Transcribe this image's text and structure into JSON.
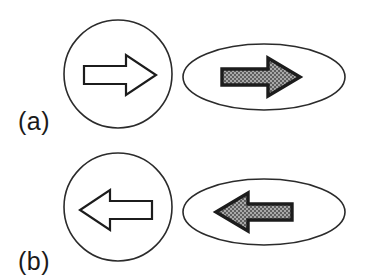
{
  "figure": {
    "background_color": "#ffffff",
    "width": 372,
    "height": 279,
    "outline_color": "#2b2b2b",
    "arrow_outline_color": "#1c1c1c",
    "arrow_hollow_fill": "#ffffff",
    "arrow_shaded_fill": "#9a9a9a",
    "arrow_shaded_pattern": "checkerboard-halftone",
    "label_color": "#1a1a1a"
  },
  "panels": [
    {
      "id": "a",
      "label": "(a)",
      "label_x": 18,
      "label_y": 130,
      "shapes": [
        {
          "name": "circle",
          "kind": "circle",
          "cx": 118,
          "cy": 74,
          "r": 54,
          "arrow": {
            "style": "hollow",
            "direction": "right",
            "label": "right-arrow-hollow",
            "cx": 120,
            "cy": 75,
            "length": 72,
            "shaft_height": 18,
            "head_width": 30,
            "head_height": 40
          }
        },
        {
          "name": "ellipse",
          "kind": "ellipse",
          "cx": 264,
          "cy": 77,
          "rx": 81,
          "ry": 33,
          "arrow": {
            "style": "shaded",
            "direction": "right",
            "label": "right-arrow-shaded",
            "cx": 261,
            "cy": 77,
            "length": 78,
            "shaft_height": 17,
            "head_width": 31,
            "head_height": 40
          }
        }
      ]
    },
    {
      "id": "b",
      "label": "(b)",
      "label_x": 18,
      "label_y": 270,
      "shapes": [
        {
          "name": "circle",
          "kind": "circle",
          "cx": 118,
          "cy": 207,
          "r": 54,
          "arrow": {
            "style": "hollow",
            "direction": "left",
            "label": "left-arrow-hollow",
            "cx": 118,
            "cy": 209,
            "length": 72,
            "shaft_height": 18,
            "head_width": 30,
            "head_height": 40
          }
        },
        {
          "name": "ellipse",
          "kind": "ellipse",
          "cx": 264,
          "cy": 212,
          "rx": 81,
          "ry": 33,
          "arrow": {
            "style": "shaded",
            "direction": "left",
            "label": "left-arrow-shaded",
            "cx": 253,
            "cy": 211,
            "length": 78,
            "shaft_height": 17,
            "head_width": 31,
            "head_height": 40
          }
        }
      ]
    }
  ]
}
